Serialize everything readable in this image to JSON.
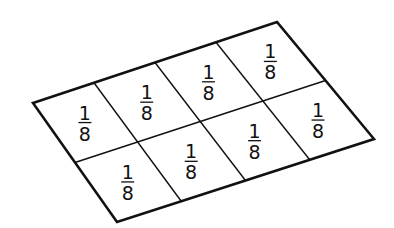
{
  "diagram": {
    "shape": "parallelogram",
    "rows": 2,
    "columns": 4,
    "stroke_color": "#111111",
    "background": "#ffffff",
    "corners": {
      "left": [
        33,
        103
      ],
      "top": [
        277,
        22
      ],
      "right": [
        374,
        139
      ],
      "bottom": [
        117,
        222
      ]
    },
    "cells": [
      {
        "row": 0,
        "col": 0,
        "numerator": "1",
        "denominator": "8"
      },
      {
        "row": 0,
        "col": 1,
        "numerator": "1",
        "denominator": "8"
      },
      {
        "row": 0,
        "col": 2,
        "numerator": "1",
        "denominator": "8"
      },
      {
        "row": 0,
        "col": 3,
        "numerator": "1",
        "denominator": "8"
      },
      {
        "row": 1,
        "col": 0,
        "numerator": "1",
        "denominator": "8"
      },
      {
        "row": 1,
        "col": 1,
        "numerator": "1",
        "denominator": "8"
      },
      {
        "row": 1,
        "col": 2,
        "numerator": "1",
        "denominator": "8"
      },
      {
        "row": 1,
        "col": 3,
        "numerator": "1",
        "denominator": "8"
      }
    ]
  }
}
